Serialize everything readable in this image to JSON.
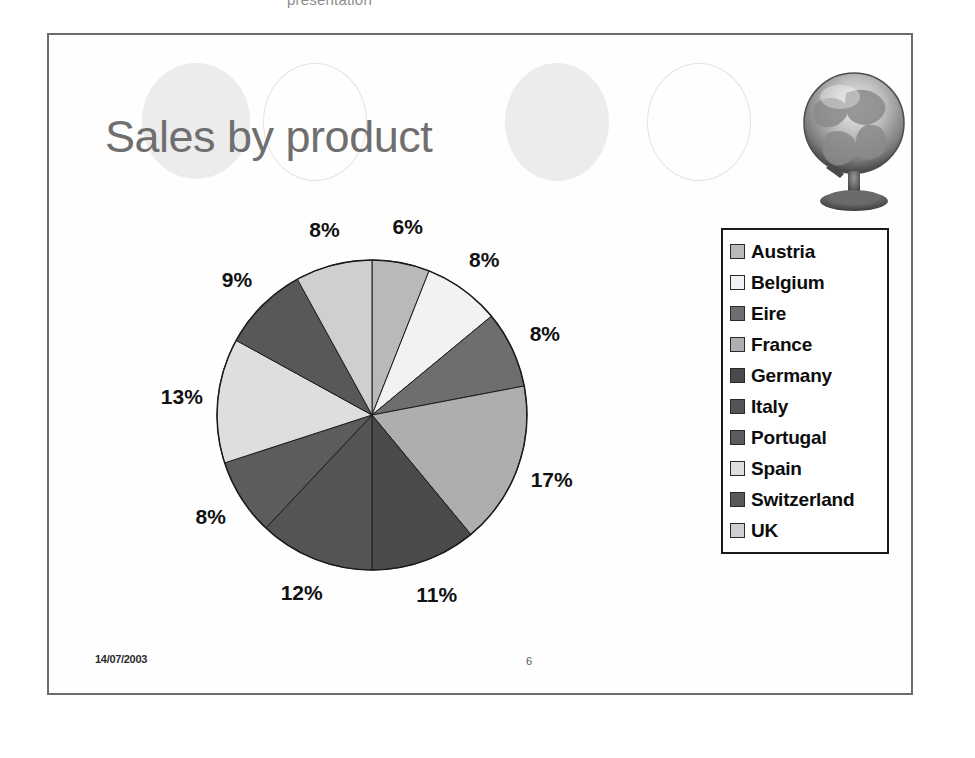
{
  "page": {
    "header_cutoff_text": "presentation"
  },
  "slide": {
    "title": "Sales by product",
    "footer": {
      "date": "14/07/2003",
      "page_number": "6"
    },
    "decorations": {
      "circles": [
        {
          "style": "filled",
          "color": "#ececec"
        },
        {
          "style": "outline",
          "color": "#e3e3e3"
        },
        {
          "style": "filled",
          "color": "#ececec"
        },
        {
          "style": "outline",
          "color": "#e3e3e3"
        }
      ],
      "globe_image": "globe-on-stand"
    }
  },
  "legend": {
    "items": [
      {
        "label": "Austria",
        "color": "#b9b9b9"
      },
      {
        "label": "Belgium",
        "color": "#f2f2f2"
      },
      {
        "label": "Eire",
        "color": "#6e6e6e"
      },
      {
        "label": "France",
        "color": "#aeaeae"
      },
      {
        "label": "Germany",
        "color": "#4a4a4a"
      },
      {
        "label": "Italy",
        "color": "#545454"
      },
      {
        "label": "Portugal",
        "color": "#5c5c5c"
      },
      {
        "label": "Spain",
        "color": "#dedede"
      },
      {
        "label": "Switzerland",
        "color": "#585858"
      },
      {
        "label": "UK",
        "color": "#cfcfcf"
      }
    ]
  },
  "chart_data": {
    "type": "pie",
    "title": "Sales by product",
    "xlabel": "",
    "ylabel": "",
    "units": "percent",
    "legend_position": "right",
    "grid": false,
    "start_angle_deg": 0,
    "direction": "clockwise",
    "categories": [
      "Austria",
      "Belgium",
      "Eire",
      "France",
      "Germany",
      "Italy",
      "Portugal",
      "Spain",
      "Switzerland",
      "UK"
    ],
    "values": [
      6,
      8,
      8,
      17,
      11,
      12,
      8,
      13,
      9,
      8
    ],
    "labels": [
      "6%",
      "8%",
      "8%",
      "17%",
      "11%",
      "12%",
      "8%",
      "13%",
      "9%",
      "8%"
    ],
    "slice_colors": [
      "#b9b9b9",
      "#f2f2f2",
      "#6e6e6e",
      "#aeaeae",
      "#4a4a4a",
      "#545454",
      "#5c5c5c",
      "#dedede",
      "#585858",
      "#cfcfcf"
    ],
    "slices": [
      {
        "name": "Austria",
        "value": 6,
        "label": "6%",
        "color": "#b9b9b9"
      },
      {
        "name": "Belgium",
        "value": 8,
        "label": "8%",
        "color": "#f2f2f2"
      },
      {
        "name": "Eire",
        "value": 8,
        "label": "8%",
        "color": "#6e6e6e"
      },
      {
        "name": "France",
        "value": 17,
        "label": "17%",
        "color": "#aeaeae"
      },
      {
        "name": "Germany",
        "value": 11,
        "label": "11%",
        "color": "#4a4a4a"
      },
      {
        "name": "Italy",
        "value": 12,
        "label": "12%",
        "color": "#545454"
      },
      {
        "name": "Portugal",
        "value": 8,
        "label": "8%",
        "color": "#5c5c5c"
      },
      {
        "name": "Spain",
        "value": 13,
        "label": "13%",
        "color": "#dedede"
      },
      {
        "name": "Switzerland",
        "value": 9,
        "label": "9%",
        "color": "#585858"
      },
      {
        "name": "UK",
        "value": 8,
        "label": "8%",
        "color": "#cfcfcf"
      }
    ]
  }
}
